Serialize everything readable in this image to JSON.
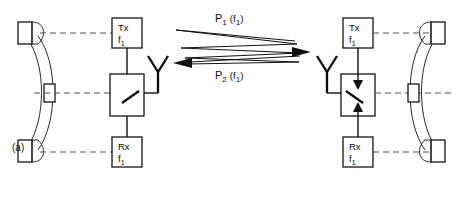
{
  "figure": {
    "caption_label": "(a)"
  },
  "left_terminal": {
    "tx_box": {
      "line1": "Tx",
      "line2_base": "f",
      "line2_sub": "1"
    },
    "rx_box": {
      "line1": "Rx",
      "line2_base": "f",
      "line2_sub": "1"
    },
    "switch_name": "transmit-receive-switch",
    "antenna_name": "antenna",
    "handset_name": "telephone-handset"
  },
  "right_terminal": {
    "tx_box": {
      "line1": "Tx",
      "line2_base": "f",
      "line2_sub": "1"
    },
    "rx_box": {
      "line1": "Rx",
      "line2_base": "f",
      "line2_sub": "1"
    },
    "switch_name": "transmit-receive-switch",
    "antenna_name": "antenna",
    "handset_name": "telephone-handset"
  },
  "propagation_paths": [
    {
      "id": "forward-path",
      "label_base": "P",
      "label_sub": "1",
      "label_arg": "(f",
      "label_arg_sub": "1",
      "label_arg_close": ")",
      "direction": "left-to-right"
    },
    {
      "id": "reverse-path",
      "label_base": "P",
      "label_sub": "2",
      "label_arg": "(f",
      "label_arg_sub": "1",
      "label_arg_close": ")",
      "direction": "right-to-left"
    }
  ],
  "colors": {
    "ink": "#111111",
    "dashed": "#555555",
    "background": "#ffffff"
  }
}
